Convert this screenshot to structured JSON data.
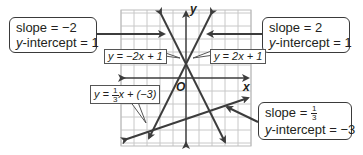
{
  "graph": {
    "x_axis_label": "x",
    "y_axis_label": "y",
    "origin_label": "O",
    "colors": {
      "line": "#3c3c3c",
      "grid": "#c8c8c8",
      "callout_border": "#3a3a3a"
    }
  },
  "callouts": [
    {
      "id": "neg2",
      "slope_text": "slope = −2",
      "intercept_prefix": "y",
      "intercept_text": "-intercept = 1"
    },
    {
      "id": "pos2",
      "slope_text": "slope = 2",
      "intercept_prefix": "y",
      "intercept_text": "-intercept = 1"
    },
    {
      "id": "third",
      "slope_prefix": "slope = ",
      "slope_num": "1",
      "slope_den": "3",
      "intercept_prefix": "y",
      "intercept_text": "-intercept = −3"
    }
  ],
  "equations": [
    {
      "id": "eq-neg2",
      "text": "y = −2x + 1"
    },
    {
      "id": "eq-pos2",
      "text": "y = 2x + 1"
    },
    {
      "id": "eq-third",
      "prefix": "y = ",
      "num": "1",
      "den": "3",
      "suffix": "x + (−3)"
    }
  ]
}
